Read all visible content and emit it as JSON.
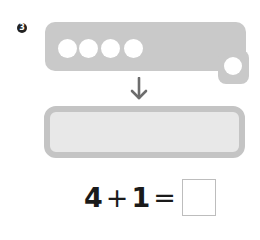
{
  "problem": {
    "number_badge": "3",
    "counters": {
      "row_filled": 4,
      "extra": 1
    },
    "arrow_icon": "down-arrow-icon",
    "equation": {
      "left": "4",
      "operator": "+",
      "right": "1",
      "equals": "=",
      "answer": ""
    }
  },
  "colors": {
    "counter_bar": "#c9c9c9",
    "answer_box_border": "#c4c4c4",
    "answer_box_fill": "#e8e8e8",
    "badge": "#222222"
  }
}
